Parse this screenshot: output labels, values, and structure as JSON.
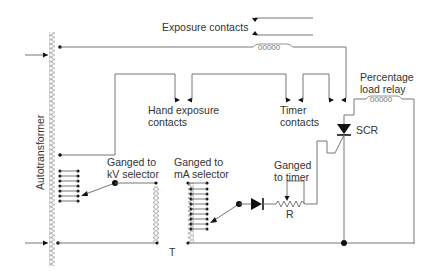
{
  "diagram": {
    "labels": {
      "exposure_contacts": "Exposure contacts",
      "hand_exposure_contacts_1": "Hand exposure",
      "hand_exposure_contacts_2": "contacts",
      "timer_contacts_1": "Timer",
      "timer_contacts_2": "contacts",
      "percentage_load_relay_1": "Percentage",
      "percentage_load_relay_2": "load relay",
      "scr": "SCR",
      "autotransformer": "Autotransformer",
      "ganged_kv_1": "Ganged to",
      "ganged_kv_2": "kV selector",
      "ganged_ma_1": "Ganged to",
      "ganged_ma_2": "mA selector",
      "ganged_timer_1": "Ganged",
      "ganged_timer_2": "to timer",
      "resistor": "R",
      "transformer": "T"
    },
    "components": [
      "autotransformer",
      "exposure-contacts",
      "relay-coil",
      "hand-exposure-contacts",
      "timer-contacts",
      "percentage-load-relay",
      "scr",
      "kv-selector",
      "ma-selector",
      "transformer-T",
      "diode",
      "variable-resistor-R"
    ],
    "colors": {
      "wire": "#666666",
      "ink": "#111111",
      "text": "#333333"
    }
  }
}
